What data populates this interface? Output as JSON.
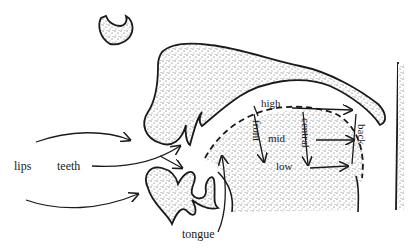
{
  "diagram": {
    "type": "vocal tract vowel chart (sagittal section)",
    "labels": {
      "lips": "lips",
      "teeth": "teeth",
      "tongue": "tongue",
      "high": "high",
      "mid": "mid",
      "low": "low",
      "front": "front",
      "central": "central",
      "back": "back"
    },
    "colors": {
      "ink": "#1a1a1a",
      "stipple": "#3a3a3a",
      "background": "#ffffff"
    }
  }
}
